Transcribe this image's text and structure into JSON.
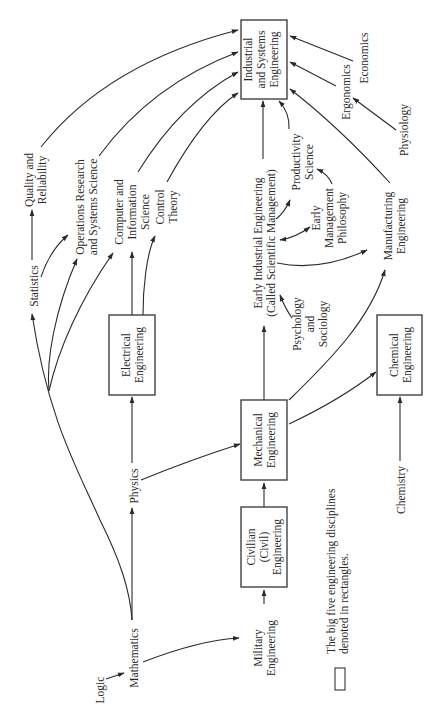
{
  "diagram": {
    "orientation": "rotated 90 degrees counter-clockwise",
    "boxed_nodes": {
      "industrial": [
        "Industrial",
        "and Systems",
        "Engineering"
      ],
      "electrical": [
        "Electrical",
        "Engineering"
      ],
      "mechanical": [
        "Mechanical",
        "Engineering"
      ],
      "civilian": [
        "Civilian",
        "(Civil)",
        "Engineering"
      ],
      "chemical": [
        "Chemical",
        "Engineering"
      ]
    },
    "nodes": {
      "logic": [
        "Logic"
      ],
      "mathematics": [
        "Mathematics"
      ],
      "military": [
        "Military",
        "Engineering"
      ],
      "physics": [
        "Physics"
      ],
      "statistics": [
        "Statistics"
      ],
      "quality": [
        "Quality and",
        "Reliability"
      ],
      "operations": [
        "Operations Research",
        "and Systems Science"
      ],
      "computer": [
        "Computer and",
        "Information",
        "Science"
      ],
      "control": [
        "Control",
        "Theory"
      ],
      "early_ie": [
        "Early Industrial Engineering",
        "(Called Scientific Management)"
      ],
      "psychology": [
        "Psychology",
        "and",
        "Sociology"
      ],
      "productivity": [
        "Productivity",
        "Science"
      ],
      "early_mgmt": [
        "Early",
        "Management",
        "Philosophy"
      ],
      "manufacturing": [
        "Manufacturing",
        "Engineering"
      ],
      "chemistry": [
        "Chemistry"
      ],
      "physiology": [
        "Physiology"
      ],
      "ergonomics": [
        "Ergonomics"
      ],
      "economics": [
        "Economics"
      ]
    },
    "edges": [
      {
        "from": "Logic",
        "to": "Mathematics"
      },
      {
        "from": "Mathematics",
        "to": "Military Engineering"
      },
      {
        "from": "Mathematics",
        "to": "Physics"
      },
      {
        "from": "Mathematics",
        "to": "Statistics"
      },
      {
        "from": "Mathematics",
        "to": "Operations Research and Systems Science"
      },
      {
        "from": "Mathematics",
        "to": "Computer and Information Science"
      },
      {
        "from": "Military Engineering",
        "to": "Civilian (Civil) Engineering"
      },
      {
        "from": "Civilian (Civil) Engineering",
        "to": "Mechanical Engineering"
      },
      {
        "from": "Physics",
        "to": "Electrical Engineering"
      },
      {
        "from": "Physics",
        "to": "Mechanical Engineering"
      },
      {
        "from": "Statistics",
        "to": "Quality and Reliability"
      },
      {
        "from": "Statistics",
        "to": "Operations Research and Systems Science"
      },
      {
        "from": "Electrical Engineering",
        "to": "Computer and Information Science"
      },
      {
        "from": "Electrical Engineering",
        "to": "Control Theory"
      },
      {
        "from": "Mechanical Engineering",
        "to": "Early Industrial Engineering"
      },
      {
        "from": "Mechanical Engineering",
        "to": "Manufacturing Engineering"
      },
      {
        "from": "Mechanical Engineering",
        "to": "Chemical Engineering"
      },
      {
        "from": "Chemistry",
        "to": "Chemical Engineering"
      },
      {
        "from": "Psychology and Sociology",
        "to": "Early Industrial Engineering"
      },
      {
        "from": "Early Industrial Engineering",
        "to": "Productivity Science"
      },
      {
        "from": "Early Industrial Engineering",
        "to": "Early Management Philosophy",
        "bidirectional": true
      },
      {
        "from": "Early Industrial Engineering",
        "to": "Manufacturing Engineering"
      },
      {
        "from": "Early Management Philosophy",
        "to": "Productivity Science"
      },
      {
        "from": "Physiology",
        "to": "Ergonomics"
      },
      {
        "from": "Quality and Reliability",
        "to": "Industrial and Systems Engineering"
      },
      {
        "from": "Operations Research and Systems Science",
        "to": "Industrial and Systems Engineering"
      },
      {
        "from": "Computer and Information Science",
        "to": "Industrial and Systems Engineering"
      },
      {
        "from": "Control Theory",
        "to": "Industrial and Systems Engineering"
      },
      {
        "from": "Early Industrial Engineering",
        "to": "Industrial and Systems Engineering"
      },
      {
        "from": "Productivity Science",
        "to": "Industrial and Systems Engineering"
      },
      {
        "from": "Manufacturing Engineering",
        "to": "Industrial and Systems Engineering"
      },
      {
        "from": "Ergonomics",
        "to": "Industrial and Systems Engineering"
      },
      {
        "from": "Economics",
        "to": "Industrial and Systems Engineering"
      }
    ],
    "legend": [
      "The big five engineering disciplines",
      "denoted in rectangles."
    ]
  }
}
